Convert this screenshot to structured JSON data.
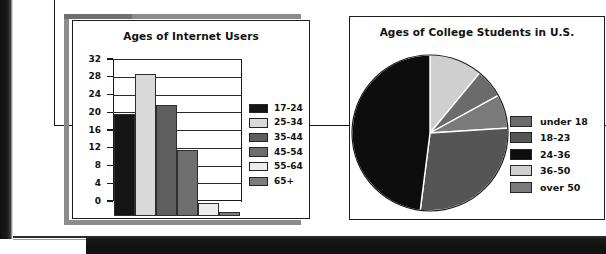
{
  "page": {
    "background_color": "#ffffff",
    "frame_color": "#8c8c8c",
    "ink_color": "#141414"
  },
  "bar_panel": {
    "title": "Ages of Internet Users"
  },
  "pie_panel": {
    "title": "Ages of College Students in U.S."
  },
  "chart_data": [
    {
      "type": "bar",
      "title": "Ages of Internet Users",
      "xlabel": "",
      "ylabel": "",
      "categories": [
        "17-24",
        "25-34",
        "35-44",
        "45-54",
        "55-64",
        "65+"
      ],
      "values": [
        23,
        32,
        25,
        15,
        3,
        1
      ],
      "colors": [
        "#151515",
        "#d9d9d9",
        "#5e5e5e",
        "#6e6e6e",
        "#ececec",
        "#7b7b7b"
      ],
      "ylim": [
        0,
        32
      ],
      "yticks": [
        0,
        4,
        8,
        12,
        16,
        20,
        24,
        28,
        32
      ],
      "ytick_labels": [
        "0",
        "4",
        "8",
        "12",
        "16",
        "20",
        "24",
        "28",
        "32"
      ],
      "grid": true,
      "legend_position": "right",
      "legend": [
        {
          "label": "17-24",
          "color": "#151515"
        },
        {
          "label": "25-34",
          "color": "#d9d9d9"
        },
        {
          "label": "35-44",
          "color": "#5e5e5e"
        },
        {
          "label": "45-54",
          "color": "#6e6e6e"
        },
        {
          "label": "55-64",
          "color": "#ececec"
        },
        {
          "label": "65+",
          "color": "#7b7b7b"
        }
      ]
    },
    {
      "type": "pie",
      "title": "Ages of College Students in U.S.",
      "legend_position": "right",
      "start_angle_deg": 0,
      "direction": "clockwise",
      "slices": [
        {
          "label": "36-50",
          "color": "#cfcfcf",
          "percent": 11
        },
        {
          "label": "under 18",
          "color": "#6b6b6b",
          "percent": 6
        },
        {
          "label": "over 50",
          "color": "#7a7a7a",
          "percent": 7
        },
        {
          "label": "18-23",
          "color": "#555555",
          "percent": 28
        },
        {
          "label": "24-36",
          "color": "#0d0d0d",
          "percent": 48
        }
      ],
      "legend": [
        {
          "label": "under 18",
          "color": "#6b6b6b"
        },
        {
          "label": "18-23",
          "color": "#555555"
        },
        {
          "label": "24-36",
          "color": "#0d0d0d"
        },
        {
          "label": "36-50",
          "color": "#cfcfcf"
        },
        {
          "label": "over 50",
          "color": "#7a7a7a"
        }
      ]
    }
  ]
}
